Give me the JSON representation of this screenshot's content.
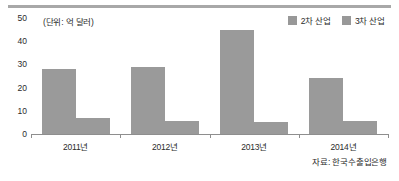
{
  "chart_data": {
    "type": "bar",
    "title": "",
    "unit_note": "(단위: 억 달러)",
    "source_note": "자료: 한국수출입은행",
    "categories": [
      "2011년",
      "2012년",
      "2013년",
      "2014년"
    ],
    "series": [
      {
        "name": "2차 산업",
        "color": "#9a9a9a",
        "values": [
          28,
          29,
          45,
          24
        ]
      },
      {
        "name": "3차 산업",
        "color": "#9a9a9a",
        "values": [
          7,
          5.5,
          5,
          5.5
        ]
      }
    ],
    "xlabel": "",
    "ylabel": "",
    "ylim": [
      0,
      50
    ],
    "yticks": [
      0,
      10,
      20,
      30,
      40,
      50
    ],
    "ytick_labels": [
      "0",
      "10",
      "20",
      "30",
      "40",
      "50"
    ],
    "grid": false,
    "legend_position": "top-right"
  },
  "legend": {
    "items": [
      {
        "label": "2차 산업",
        "color": "#9a9a9a"
      },
      {
        "label": "3차 산업",
        "color": "#9a9a9a"
      }
    ]
  },
  "axes": {
    "y_tick_labels": [
      "50",
      "40",
      "30",
      "20",
      "10",
      "0"
    ],
    "x_tick_labels": [
      "2011년",
      "2012년",
      "2013년",
      "2014년"
    ]
  },
  "colors": {
    "bar": "#9a9a9a",
    "axis": "#8e8e8e",
    "rule": "#a8a8a8",
    "text": "#2b2b2b"
  }
}
